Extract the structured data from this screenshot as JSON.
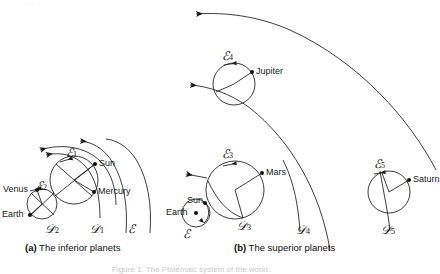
{
  "figure": {
    "type": "epicycle-astronomy-diagram",
    "background_color": "#ffffff",
    "stroke_color": "#1a1a1a",
    "panels": [
      {
        "id": "a",
        "caption_tag": "(a)",
        "caption_text": "The inferior planets",
        "bodies": [
          {
            "name": "Sun",
            "label": "Sun"
          },
          {
            "name": "Mercury",
            "label": "Mercury"
          },
          {
            "name": "Venus",
            "label": "Venus"
          },
          {
            "name": "Earth",
            "label": "Earth"
          }
        ],
        "epicycles": [
          {
            "symbol": "E",
            "subscript": "1",
            "planet": "Mercury"
          },
          {
            "symbol": "E",
            "subscript": "2",
            "planet": "Venus"
          }
        ],
        "deferents": [
          {
            "symbol": "D",
            "subscript": "1"
          },
          {
            "symbol": "D",
            "subscript": "2"
          }
        ],
        "ecliptic": {
          "symbol": "E",
          "subscript": ""
        }
      },
      {
        "id": "b",
        "caption_tag": "(b)",
        "caption_text": "The superior planets",
        "bodies": [
          {
            "name": "Jupiter",
            "label": "Jupiter"
          },
          {
            "name": "Mars",
            "label": "Mars"
          },
          {
            "name": "Saturn",
            "label": "Saturn"
          },
          {
            "name": "Sun",
            "label": "Sun"
          },
          {
            "name": "Earth",
            "label": "Earth"
          }
        ],
        "epicycles": [
          {
            "symbol": "E",
            "subscript": "3",
            "planet": "Mars"
          },
          {
            "symbol": "E",
            "subscript": "4",
            "planet": "Jupiter"
          },
          {
            "symbol": "E",
            "subscript": "5",
            "planet": "Saturn"
          }
        ],
        "deferents": [
          {
            "symbol": "D",
            "subscript": "3"
          },
          {
            "symbol": "D",
            "subscript": "4"
          },
          {
            "symbol": "D",
            "subscript": "5"
          }
        ],
        "ecliptic": {
          "symbol": "E",
          "subscript": ""
        }
      }
    ]
  },
  "labels": {
    "panel_a": {
      "sun": "Sun",
      "mercury": "Mercury",
      "venus": "Venus",
      "earth": "Earth",
      "epicycle1_sym": "ℰ",
      "epicycle1_sub": "1",
      "epicycle2_sym": "ℰ",
      "epicycle2_sub": "2",
      "deferent1_sym": "𝒟",
      "deferent1_sub": "1",
      "deferent2_sym": "𝒟",
      "deferent2_sub": "2",
      "ecliptic_sym": "ℰ"
    },
    "panel_b": {
      "jupiter": "Jupiter",
      "mars": "Mars",
      "saturn": "Saturn",
      "sun": "Sun",
      "earth": "Earth",
      "epicycle3_sym": "ℰ",
      "epicycle3_sub": "3",
      "epicycle4_sym": "ℰ",
      "epicycle4_sub": "4",
      "epicycle5_sym": "ℰ",
      "epicycle5_sub": "5",
      "deferent3_sym": "𝒟",
      "deferent3_sub": "3",
      "deferent4_sym": "𝒟",
      "deferent4_sub": "4",
      "deferent5_sym": "𝒟",
      "deferent5_sub": "5",
      "ecliptic_sym": "ℰ"
    }
  },
  "captions": {
    "panel_a_tag": "(a)",
    "panel_a_text": "The inferior planets",
    "panel_b_tag": "(b)",
    "panel_b_text": "The superior planets"
  },
  "footer": {
    "figure_caption": "Figure 1. The Ptolemaic system of the world."
  }
}
